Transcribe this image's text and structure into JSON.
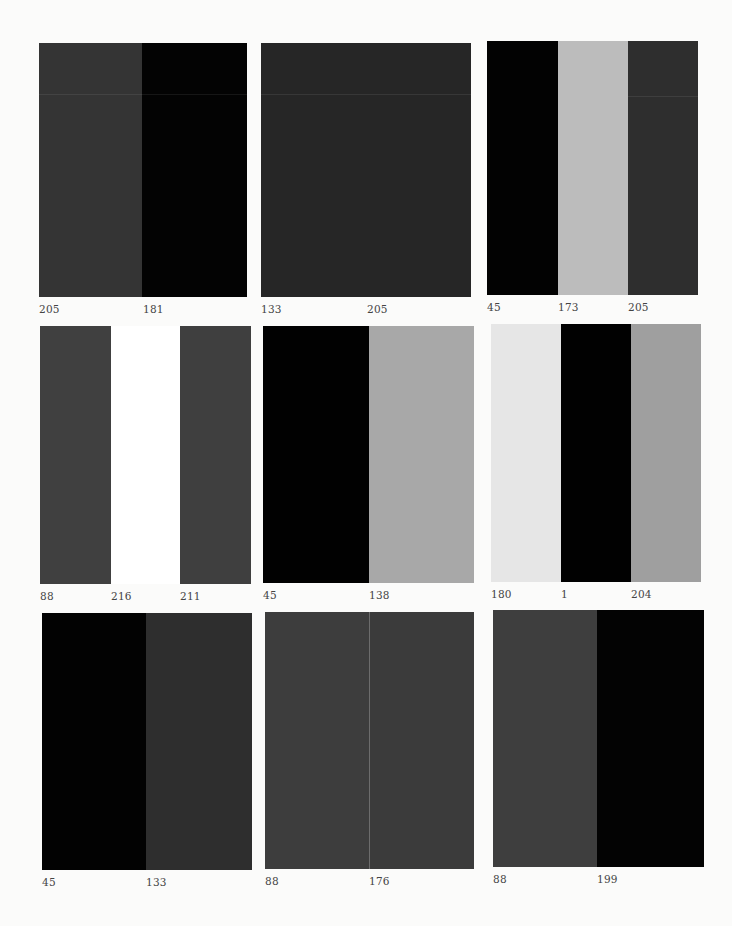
{
  "panels": [
    {
      "id": "r1c1",
      "box": {
        "x": 39,
        "y": 43,
        "w": 208,
        "h": 254
      },
      "strips": [
        {
          "color": "#343434",
          "w": 103,
          "label": "205",
          "label_x": 0
        },
        {
          "color": "#030303",
          "w": 105,
          "label": "181",
          "label_x": 104
        }
      ]
    },
    {
      "id": "r1c2",
      "box": {
        "x": 261,
        "y": 43,
        "w": 210,
        "h": 254
      },
      "strips": [
        {
          "color": "#262626",
          "w": 105,
          "label": "133",
          "label_x": 0
        },
        {
          "color": "#262626",
          "w": 105,
          "label": "205",
          "label_x": 106
        }
      ]
    },
    {
      "id": "r1c3",
      "box": {
        "x": 487,
        "y": 41,
        "w": 211,
        "h": 254
      },
      "strips": [
        {
          "color": "#020202",
          "w": 71,
          "label": "45",
          "label_x": 0
        },
        {
          "color": "#bcbcbc",
          "w": 70,
          "label": "173",
          "label_x": 71
        },
        {
          "color": "#2e2e2e",
          "w": 70,
          "label": "205",
          "label_x": 141
        }
      ]
    },
    {
      "id": "r2c1",
      "box": {
        "x": 40,
        "y": 326,
        "w": 211,
        "h": 258
      },
      "strips": [
        {
          "color": "#404040",
          "w": 71,
          "label": "88",
          "label_x": 0
        },
        {
          "color": "#ffffff",
          "w": 69,
          "label": "216",
          "label_x": 71
        },
        {
          "color": "#3f3f3f",
          "w": 71,
          "label": "211",
          "label_x": 140
        }
      ]
    },
    {
      "id": "r2c2",
      "box": {
        "x": 263,
        "y": 326,
        "w": 211,
        "h": 257
      },
      "strips": [
        {
          "color": "#010101",
          "w": 106,
          "label": "45",
          "label_x": 0
        },
        {
          "color": "#a8a8a8",
          "w": 105,
          "label": "138",
          "label_x": 106
        }
      ]
    },
    {
      "id": "r2c3",
      "box": {
        "x": 491,
        "y": 324,
        "w": 210,
        "h": 258
      },
      "strips": [
        {
          "color": "#e6e6e6",
          "w": 70,
          "label": "180",
          "label_x": 0
        },
        {
          "color": "#010101",
          "w": 70,
          "label": "1",
          "label_x": 70
        },
        {
          "color": "#9f9f9f",
          "w": 70,
          "label": "204",
          "label_x": 140
        }
      ]
    },
    {
      "id": "r3c1",
      "box": {
        "x": 42,
        "y": 613,
        "w": 210,
        "h": 257
      },
      "strips": [
        {
          "color": "#020202",
          "w": 104,
          "label": "45",
          "label_x": 0
        },
        {
          "color": "#2e2e2e",
          "w": 106,
          "label": "133",
          "label_x": 104
        }
      ]
    },
    {
      "id": "r3c2",
      "box": {
        "x": 265,
        "y": 612,
        "w": 209,
        "h": 257
      },
      "strips": [
        {
          "color": "#3d3d3d",
          "w": 104,
          "label": "88",
          "label_x": 0
        },
        {
          "color": "#3b3b3b",
          "w": 105,
          "label": "176",
          "label_x": 104
        }
      ]
    },
    {
      "id": "r3c3",
      "box": {
        "x": 493,
        "y": 610,
        "w": 211,
        "h": 257
      },
      "strips": [
        {
          "color": "#3e3e3e",
          "w": 104,
          "label": "88",
          "label_x": 0
        },
        {
          "color": "#030303",
          "w": 107,
          "label": "199",
          "label_x": 104
        }
      ]
    }
  ]
}
